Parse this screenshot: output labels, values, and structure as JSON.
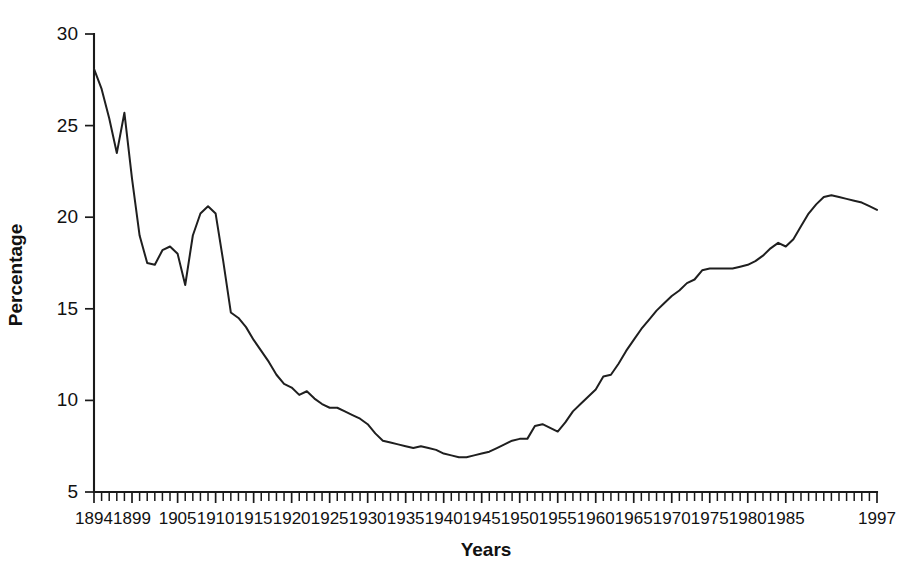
{
  "chart_data": {
    "type": "line",
    "title": "",
    "xlabel": "Years",
    "ylabel": "Percentage",
    "xlim": [
      1894,
      1997
    ],
    "ylim": [
      5,
      30
    ],
    "yticks": [
      5,
      10,
      15,
      20,
      25,
      30
    ],
    "xticks": [
      1894,
      1899,
      1905,
      1910,
      1915,
      1920,
      1925,
      1930,
      1935,
      1940,
      1945,
      1950,
      1955,
      1960,
      1965,
      1970,
      1975,
      1980,
      1985,
      1997
    ],
    "xtick_labels": [
      "1894",
      "1899",
      "1905",
      "1910",
      "1915",
      "1920",
      "1925",
      "1930",
      "1935",
      "1940",
      "1945",
      "1950",
      "1955",
      "1960",
      "1965",
      "1970",
      "1975",
      "1980",
      "1985",
      "1997"
    ],
    "grid": false,
    "legend": "none",
    "minor_tick_interval": 1,
    "line_color": "#1f1f1f",
    "axis_color": "#1a1a1a",
    "background_color": "#ffffff",
    "series": [
      {
        "name": "Percentage",
        "x": [
          1894,
          1895,
          1896,
          1897,
          1898,
          1899,
          1900,
          1901,
          1902,
          1903,
          1904,
          1905,
          1906,
          1907,
          1908,
          1909,
          1910,
          1911,
          1912,
          1913,
          1914,
          1915,
          1916,
          1917,
          1918,
          1919,
          1920,
          1921,
          1922,
          1923,
          1924,
          1925,
          1926,
          1927,
          1928,
          1929,
          1930,
          1931,
          1932,
          1933,
          1934,
          1935,
          1936,
          1937,
          1938,
          1939,
          1940,
          1941,
          1942,
          1943,
          1944,
          1945,
          1946,
          1947,
          1948,
          1949,
          1950,
          1951,
          1952,
          1953,
          1954,
          1955,
          1956,
          1957,
          1958,
          1959,
          1960,
          1961,
          1962,
          1963,
          1964,
          1965,
          1966,
          1967,
          1968,
          1969,
          1970,
          1971,
          1972,
          1973,
          1974,
          1975,
          1976,
          1977,
          1978,
          1979,
          1980,
          1981,
          1982,
          1983,
          1984,
          1985,
          1986,
          1987,
          1988,
          1989,
          1990,
          1991,
          1992,
          1993,
          1994,
          1995,
          1996,
          1997
        ],
        "values": [
          28.1,
          27.0,
          25.4,
          23.5,
          25.7,
          22.1,
          19.0,
          17.5,
          17.4,
          18.2,
          18.4,
          18.0,
          16.3,
          19.0,
          20.2,
          20.6,
          20.2,
          17.6,
          14.8,
          14.5,
          14.0,
          13.3,
          12.7,
          12.1,
          11.4,
          10.9,
          10.7,
          10.3,
          10.5,
          10.1,
          9.8,
          9.6,
          9.6,
          9.4,
          9.2,
          9.0,
          8.7,
          8.2,
          7.8,
          7.7,
          7.6,
          7.5,
          7.4,
          7.5,
          7.4,
          7.3,
          7.1,
          7.0,
          6.9,
          6.9,
          7.0,
          7.1,
          7.2,
          7.4,
          7.6,
          7.8,
          7.9,
          7.9,
          8.6,
          8.7,
          8.5,
          8.3,
          8.8,
          9.4,
          9.8,
          10.2,
          10.6,
          11.3,
          11.4,
          12.0,
          12.7,
          13.3,
          13.9,
          14.4,
          14.9,
          15.3,
          15.7,
          16.0,
          16.4,
          16.6,
          17.1,
          17.2,
          17.2,
          17.2,
          17.2,
          17.3,
          17.4,
          17.6,
          17.9,
          18.3,
          18.6,
          18.4,
          18.8,
          19.5,
          20.2,
          20.7,
          21.1,
          21.2,
          21.1,
          21.0,
          20.9,
          20.8,
          20.6,
          20.4
        ]
      }
    ]
  }
}
